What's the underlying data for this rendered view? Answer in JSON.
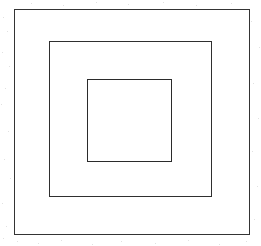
{
  "figure": {
    "kind": "line-drawing",
    "canvas": {
      "width": 261,
      "height": 246,
      "background_color": "#ffffff"
    },
    "shapes": [
      {
        "id": "outer",
        "name": "outer-square",
        "shape": "square",
        "x": 14,
        "y": 9,
        "width": 236,
        "height": 226,
        "stroke_color": "#343434",
        "stroke_width": 1.4,
        "fill": "none"
      },
      {
        "id": "middle",
        "name": "middle-square",
        "shape": "square",
        "x": 49,
        "y": 41,
        "width": 163,
        "height": 156,
        "stroke_color": "#2f2f2f",
        "stroke_width": 1.3,
        "fill": "none"
      },
      {
        "id": "inner",
        "name": "inner-square",
        "shape": "square",
        "x": 87,
        "y": 79,
        "width": 85,
        "height": 83,
        "stroke_color": "#2b2b2b",
        "stroke_width": 1.2,
        "fill": "none"
      }
    ],
    "labels": [],
    "annotations": []
  }
}
